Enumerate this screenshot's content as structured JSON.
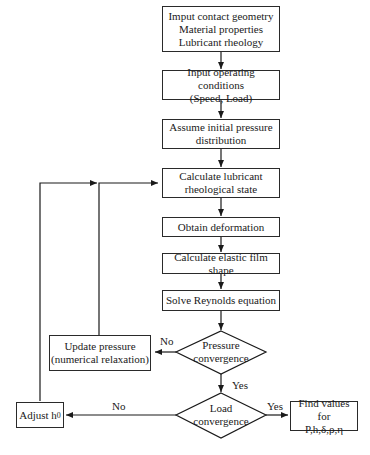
{
  "diagram": {
    "type": "flowchart",
    "nodes": {
      "input_geometry": {
        "lines": [
          "Imput contact geometry",
          "Material properties",
          "Lubricant rheology"
        ]
      },
      "input_conditions": {
        "lines": [
          "Input operating conditions",
          "(Speed, Load)"
        ]
      },
      "assume_pressure": {
        "lines": [
          "Assume initial pressure",
          "distribution"
        ]
      },
      "calc_rheology": {
        "lines": [
          "Calculate lubricant",
          "rheological state"
        ]
      },
      "deformation": {
        "lines": [
          "Obtain deformation"
        ]
      },
      "film_shape": {
        "lines": [
          "Calculate elastic film shape"
        ]
      },
      "reynolds": {
        "lines": [
          "Solve Reynolds equation"
        ]
      },
      "pressure_conv": {
        "lines": [
          "Pressure",
          "convergence"
        ]
      },
      "update_pressure": {
        "lines": [
          "Update pressure",
          "(numerical relaxation)"
        ]
      },
      "load_conv": {
        "lines": [
          "Load",
          "convergence"
        ]
      },
      "adjust_h0": {
        "text": "Adjust h",
        "sub": "0"
      },
      "find_values": {
        "lines": [
          "Find values for",
          "P,h,δ,ρ,η"
        ]
      }
    },
    "edge_labels": {
      "pressure_no": "No",
      "pressure_yes": "Yes",
      "load_no": "No",
      "load_yes": "Yes"
    }
  }
}
